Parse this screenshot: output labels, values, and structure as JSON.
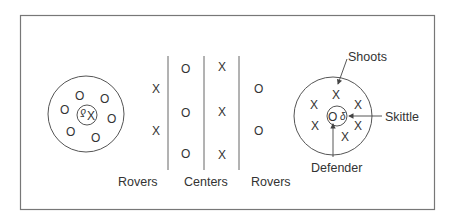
{
  "diagram": {
    "type": "skittles-field-layout",
    "colors": {
      "stroke": "#555555",
      "text": "#333333",
      "background": "#ffffff"
    },
    "left_circle": {
      "center_player": "X",
      "skittle_glyph": "δ",
      "ring_players": [
        "O",
        "O",
        "O",
        "O",
        "O",
        "O",
        "O"
      ]
    },
    "middle": {
      "rovers_left": [
        "X",
        "X"
      ],
      "centers_col1": [
        "O",
        "O",
        "O"
      ],
      "centers_col2": [
        "X",
        "X",
        "X"
      ],
      "rovers_right": [
        "O",
        "O"
      ]
    },
    "right_circle": {
      "center_player": "O",
      "skittle_glyph": "δ",
      "ring_players": [
        "X",
        "X",
        "X",
        "X",
        "X",
        "X"
      ]
    },
    "labels": {
      "rovers_left": "Rovers",
      "centers": "Centers",
      "rovers_right": "Rovers",
      "shoots": "Shoots",
      "skittle": "Skittle",
      "defender": "Defender"
    }
  }
}
